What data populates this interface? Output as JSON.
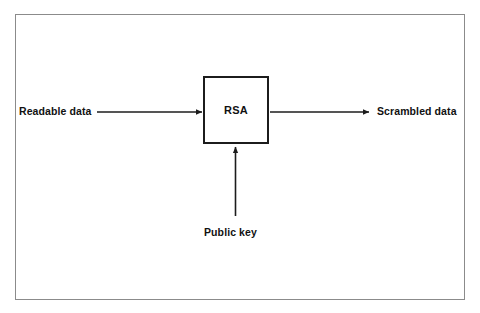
{
  "figure": {
    "type": "block-flow-diagram",
    "background_color": "#ffffff",
    "frame_color": "#8b8b8b",
    "stroke_color": "#1c1c1c",
    "text_color": "#111111"
  },
  "nodes": {
    "process": {
      "id": "rsa",
      "label": "RSA",
      "shape": "square",
      "x": 203,
      "y": 76,
      "width": 66,
      "height": 68
    },
    "input": {
      "id": "readable-data",
      "label": "Readable data"
    },
    "output": {
      "id": "scrambled-data",
      "label": "Scrambled data"
    },
    "key": {
      "id": "public-key",
      "label": "Public key"
    }
  },
  "edges": [
    {
      "id": "readable-data-to-rsa",
      "from": "readable-data",
      "to": "rsa",
      "direction": "left-to-right",
      "arrowhead": "end"
    },
    {
      "id": "rsa-to-scrambled-data",
      "from": "rsa",
      "to": "scrambled-data",
      "direction": "left-to-right",
      "arrowhead": "end"
    },
    {
      "id": "public-key-to-rsa",
      "from": "public-key",
      "to": "rsa",
      "direction": "bottom-to-top",
      "arrowhead": "end"
    }
  ]
}
